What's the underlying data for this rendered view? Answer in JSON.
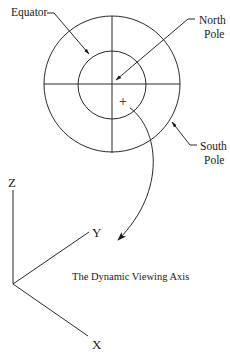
{
  "diagram": {
    "labels": {
      "equator": "Equator",
      "north_pole_line1": "North",
      "north_pole_line2": "Pole",
      "south_pole_line1": "South",
      "south_pole_line2": "Pole"
    },
    "marker": "+",
    "axes": {
      "z": "Z",
      "y": "Y",
      "x": "X"
    },
    "caption": "The Dynamic Viewing Axis",
    "colors": {
      "stroke": "#2a2a2a",
      "background": "#ffffff"
    }
  }
}
